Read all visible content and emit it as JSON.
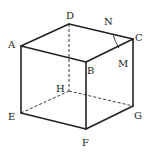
{
  "diagram": {
    "vertices": {
      "A": {
        "label": "A",
        "x": 21,
        "y": 46
      },
      "B": {
        "label": "B",
        "x": 86,
        "y": 62
      },
      "C": {
        "label": "C",
        "x": 133,
        "y": 39
      },
      "D": {
        "label": "D",
        "x": 69,
        "y": 24
      },
      "E": {
        "label": "E",
        "x": 21,
        "y": 113
      },
      "F": {
        "label": "F",
        "x": 86,
        "y": 129
      },
      "G": {
        "label": "G",
        "x": 133,
        "y": 106
      },
      "H": {
        "label": "H",
        "x": 69,
        "y": 91
      }
    },
    "points": {
      "N": {
        "label": "N",
        "on_edge": "DC"
      },
      "M": {
        "label": "M",
        "on_edge": "BC"
      }
    },
    "solid_edges": [
      "AB",
      "BC",
      "CD",
      "DA",
      "AE",
      "BF",
      "CG",
      "EF",
      "FG"
    ],
    "hidden_edges": [
      "DH",
      "EH",
      "HG"
    ],
    "arc": "N-M",
    "colors": {
      "stroke": "#222222",
      "background": "#ffffff"
    }
  }
}
